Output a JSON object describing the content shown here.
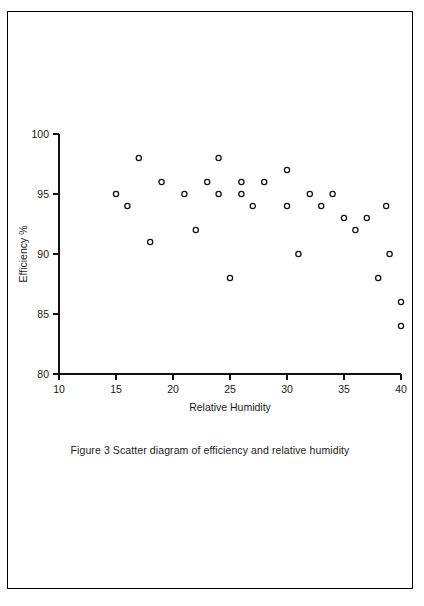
{
  "figure": {
    "caption": "Figure 3  Scatter diagram of efficiency and relative humidity"
  },
  "chart_data": {
    "type": "scatter",
    "title": "",
    "xlabel": "Relative Humidity",
    "ylabel": "Efficiency %",
    "xlim": [
      10,
      40
    ],
    "ylim": [
      80,
      100
    ],
    "xticks": [
      10,
      15,
      20,
      25,
      30,
      35,
      40
    ],
    "xtick_labels": [
      "10",
      "15",
      "20",
      "25",
      "30",
      "35",
      "40"
    ],
    "yticks": [
      80,
      85,
      90,
      95,
      100
    ],
    "ytick_labels": [
      "80",
      "85",
      "90",
      "95",
      "100"
    ],
    "grid": false,
    "legend": null,
    "marker": "open-circle",
    "marker_color": "#111111",
    "points": [
      {
        "x": 15,
        "y": 95
      },
      {
        "x": 16,
        "y": 94
      },
      {
        "x": 17,
        "y": 98
      },
      {
        "x": 18,
        "y": 91
      },
      {
        "x": 19,
        "y": 96
      },
      {
        "x": 21,
        "y": 95
      },
      {
        "x": 22,
        "y": 92
      },
      {
        "x": 23,
        "y": 96
      },
      {
        "x": 24,
        "y": 98
      },
      {
        "x": 24,
        "y": 95
      },
      {
        "x": 25,
        "y": 88
      },
      {
        "x": 26,
        "y": 96
      },
      {
        "x": 26,
        "y": 95
      },
      {
        "x": 27,
        "y": 94
      },
      {
        "x": 28,
        "y": 96
      },
      {
        "x": 30,
        "y": 97
      },
      {
        "x": 30,
        "y": 94
      },
      {
        "x": 31,
        "y": 90
      },
      {
        "x": 32,
        "y": 95
      },
      {
        "x": 33,
        "y": 94
      },
      {
        "x": 34,
        "y": 95
      },
      {
        "x": 35,
        "y": 93
      },
      {
        "x": 36,
        "y": 92
      },
      {
        "x": 37,
        "y": 93
      },
      {
        "x": 38,
        "y": 88
      },
      {
        "x": 38.7,
        "y": 94
      },
      {
        "x": 39,
        "y": 90
      },
      {
        "x": 40,
        "y": 86
      },
      {
        "x": 40,
        "y": 84
      }
    ]
  }
}
